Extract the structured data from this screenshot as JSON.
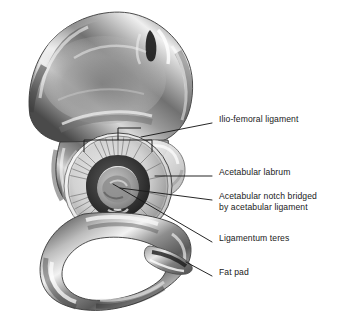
{
  "figure": {
    "background_color": "#ffffff",
    "text_color": "#1a1a1a"
  },
  "labels": [
    {
      "id": "ilio-femoral-ligament",
      "text": "Ilio-femoral ligament",
      "x": 219,
      "y": 119,
      "leader": {
        "x1": 212,
        "y1": 123,
        "x2": 141,
        "y2": 137
      }
    },
    {
      "id": "acetabular-labrum",
      "text": "Acetabular labrum",
      "x": 219,
      "y": 172,
      "leader": {
        "x1": 212,
        "y1": 176,
        "x2": 155,
        "y2": 176
      }
    },
    {
      "id": "acetabular-notch",
      "line1": "Acetabular notch bridged",
      "line2": "by acetabular ligament",
      "x": 219,
      "y": 196,
      "leader": {
        "x1": 212,
        "y1": 200,
        "x2": 120,
        "y2": 188
      }
    },
    {
      "id": "ligamentum-teres",
      "text": "Ligamentum teres",
      "x": 219,
      "y": 238,
      "leader": {
        "x1": 212,
        "y1": 242,
        "x2": 113,
        "y2": 184
      }
    },
    {
      "id": "fat-pad",
      "text": "Fat pad",
      "x": 219,
      "y": 272,
      "leader": {
        "x1": 212,
        "y1": 276,
        "x2": 186,
        "y2": 262
      }
    }
  ],
  "anatomy": {
    "ilium_label": "iliac-wing",
    "obturator_foramen_label": "obturator-foramen",
    "acetabulum_label": "acetabulum",
    "labrum_label": "acetabular-labrum-ring",
    "fossa_label": "acetabular-fossa",
    "ischial_tuberosity_label": "ischial-tuberosity",
    "bracket_label": "ilio-femoral-ligament-bracket"
  }
}
